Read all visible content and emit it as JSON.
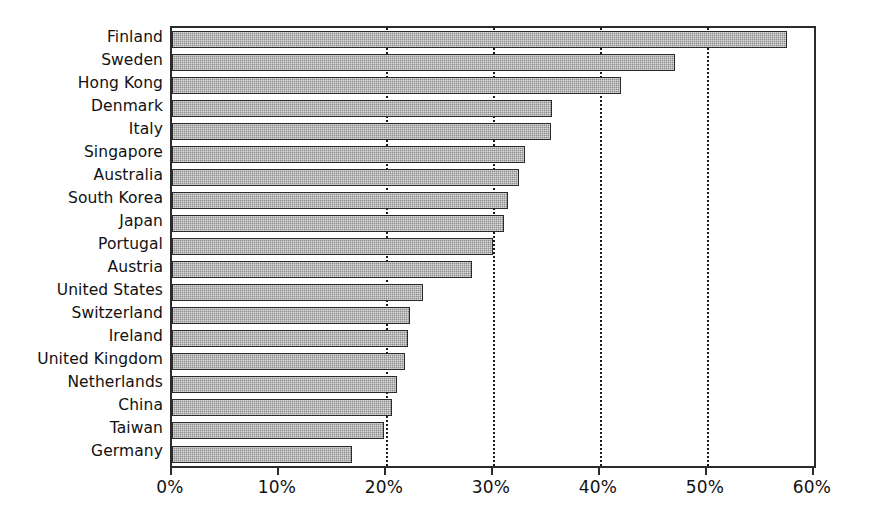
{
  "chart_data": {
    "type": "bar",
    "orientation": "horizontal",
    "title": "",
    "subtitle": "",
    "xlabel": "",
    "ylabel": "",
    "categories": [
      "Finland",
      "Sweden",
      "Hong Kong",
      "Denmark",
      "Italy",
      "Singapore",
      "Australia",
      "South Korea",
      "Japan",
      "Portugal",
      "Austria",
      "United States",
      "Switzerland",
      "Ireland",
      "United Kingdom",
      "Netherlands",
      "China",
      "Taiwan",
      "Germany"
    ],
    "values": [
      57.5,
      47.0,
      42.0,
      35.5,
      35.4,
      33.0,
      32.4,
      31.4,
      31.0,
      30.0,
      28.0,
      23.5,
      22.2,
      22.1,
      21.8,
      21.0,
      20.6,
      19.8,
      16.8
    ],
    "value_format": "percent",
    "xlim": [
      0,
      60
    ],
    "tick_values": [
      0,
      10,
      20,
      30,
      40,
      50,
      60
    ],
    "tick_labels": [
      "0%",
      "10%",
      "20%",
      "30%",
      "40%",
      "50%",
      "60%"
    ],
    "gridlines": {
      "x": [
        20,
        30,
        40,
        50
      ],
      "style": "dotted",
      "y": false
    },
    "legend": null,
    "colors": {
      "bar_fill": "#8c8c8c",
      "bar_border": "#2a2a2a",
      "axis": "#2b2b2b",
      "grid": "#1a1a1a",
      "text": "#111111",
      "background": "#ffffff"
    }
  }
}
